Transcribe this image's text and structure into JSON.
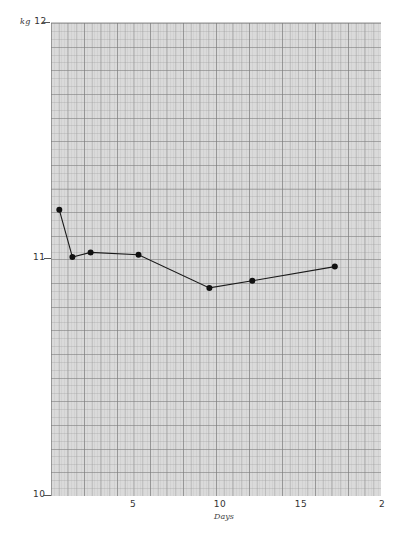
{
  "chart_data": {
    "type": "line",
    "title": "",
    "xlabel": "Days",
    "ylabel": "kg",
    "xlim": [
      0,
      20
    ],
    "ylim": [
      10,
      12
    ],
    "grid": true,
    "legend": null,
    "x_ticks": [
      "5",
      "10",
      "15",
      "2"
    ],
    "x_tick_values": [
      5,
      10,
      15,
      20
    ],
    "y_ticks": [
      "10",
      "11",
      "12"
    ],
    "y_tick_values": [
      10,
      11,
      12
    ],
    "y_unit_label": "kg",
    "series": [
      {
        "name": "Weight",
        "color": "#1a1a1a",
        "marker": "filled-circle",
        "x": [
          0.5,
          1.3,
          2.4,
          5.3,
          9.6,
          12.2,
          17.2
        ],
        "y": [
          11.21,
          11.01,
          11.03,
          11.02,
          10.88,
          10.91,
          10.97
        ]
      }
    ]
  },
  "axes": {
    "y_unit": "kg",
    "y_labels": {
      "top": "12",
      "mid": "11",
      "bottom": "10"
    },
    "x_labels": {
      "t5": "5",
      "t10": "10",
      "t15": "15",
      "t20": "2"
    },
    "x_title": "Days"
  },
  "colors": {
    "grid_background": "#dadada",
    "line": "#1a1a1a",
    "marker": "#111111"
  }
}
